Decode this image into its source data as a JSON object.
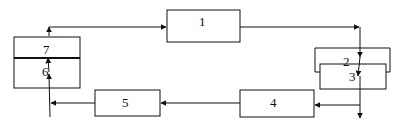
{
  "diagram": {
    "type": "block-flow-diagram",
    "blocks": [
      {
        "id": "1",
        "label": "1"
      },
      {
        "id": "2",
        "label": "2"
      },
      {
        "id": "3",
        "label": "3"
      },
      {
        "id": "4",
        "label": "4"
      },
      {
        "id": "5",
        "label": "5"
      },
      {
        "id": "6",
        "label": "6"
      },
      {
        "id": "7",
        "label": "7"
      }
    ],
    "edges": [
      {
        "from": "7",
        "to": "1"
      },
      {
        "from": "1",
        "to": "2"
      },
      {
        "from": "2",
        "to": "3"
      },
      {
        "from": "3",
        "to": "4"
      },
      {
        "from": "3",
        "to": "out"
      },
      {
        "from": "4",
        "to": "5"
      },
      {
        "from": "5",
        "to": "6"
      },
      {
        "from": "6",
        "to": "7"
      }
    ],
    "colors": {
      "line": "#111111",
      "background": "#ffffff"
    }
  }
}
